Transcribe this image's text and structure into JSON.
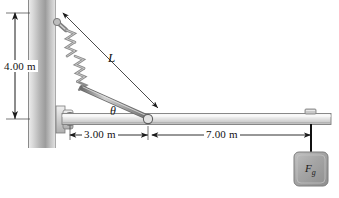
{
  "figure": {
    "type": "physics-free-body-diagram",
    "background_color": "#ffffff"
  },
  "labels": {
    "wall_height_dimension": "4.00 m",
    "hinge_to_spring_dimension": "3.00 m",
    "spring_to_weight_dimension": "7.00 m",
    "spring_length_symbol": "L",
    "angle_symbol": "θ",
    "weight_force_symbol": "F",
    "weight_force_subscript": "g"
  },
  "colors": {
    "wall_light": "#f2f2f2",
    "wall_mid": "#a8a8a8",
    "wall_dark": "#d9d9d9",
    "beam_light": "#f4f4f4",
    "beam_mid": "#d6d6d6",
    "beam_edge": "#6e6e6e",
    "spring_gray": "#9a9a9a",
    "rod_gray": "#8c8c8c",
    "block_fill": "#a6a6a6",
    "block_edge": "#7a7a7a",
    "line_black": "#1a1a1a"
  },
  "elements": {
    "wall": "vertical-wall",
    "hinge": "hinge-pivot-bracket",
    "beam": "horizontal-beam",
    "spring": "coil-spring",
    "rod": "connecting-rod",
    "weight_block": "hanging-weight-block",
    "string": "hanging-string",
    "beam_clamp": "beam-top-clamp"
  },
  "geometry": {
    "wall_x": 28,
    "wall_top": 0,
    "wall_bottom": 148,
    "beam_y": 119,
    "beam_left": 62,
    "beam_right": 331,
    "hinge_x": 70,
    "spring_anchor_x": 148,
    "weight_x": 311
  }
}
